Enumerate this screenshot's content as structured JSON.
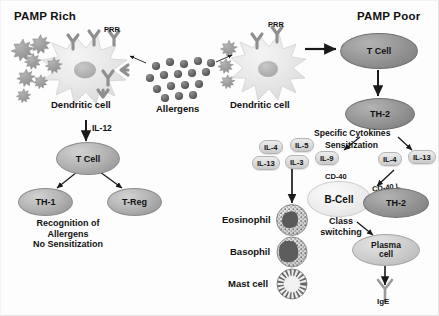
{
  "figure": {
    "type": "biology-pathway-diagram"
  },
  "headings": {
    "left": "PAMP Rich",
    "right": "PAMP Poor"
  },
  "left_branch": {
    "dendritic_cell_label": "Dendritic cell",
    "prr_label": "PRR",
    "cytokine_arrow_label": "IL-12",
    "t_cell": "T Cell",
    "th1": "TH-1",
    "treg": "T-Reg",
    "outcome_lines": [
      "Recognition of",
      "Allergens",
      "No Sensitization"
    ]
  },
  "center": {
    "allergens_label": "Allergens"
  },
  "right_branch": {
    "dendritic_cell_label": "Dendritic cell",
    "prr_label": "PRR",
    "t_cell": "T Cell",
    "th2_top": "TH-2",
    "specific_cytokines_label": "Specific Cytokines",
    "sensitization_label": "Sensitization",
    "cytokines_left": [
      "IL-4",
      "IL-5",
      "IL-13",
      "IL-3",
      "IL-9"
    ],
    "cytokines_right": [
      "IL-4",
      "IL-13"
    ],
    "b_cell": "B-Cell",
    "cd40": "CD-40",
    "cd40l": "CD-40 L",
    "th2_right": "TH-2",
    "class_switching_lines": [
      "Class",
      "switching"
    ],
    "plasma_cell_lines": [
      "Plasma",
      "cell"
    ],
    "ige_label": "IgE",
    "effector_cells": [
      "Eosinophil",
      "Basophil",
      "Mast cell"
    ]
  },
  "colors": {
    "background": "#fdfdfd",
    "text": "#111111",
    "cell_mid_gray": "#b6b6b6",
    "cell_dark_gray": "#9a9a9a",
    "cell_light_gray": "#cfcfcf",
    "pamp_gray": "#9b9b9b",
    "allergen_gray": "#6e6e6e",
    "arrow": "#1a1a1a"
  }
}
